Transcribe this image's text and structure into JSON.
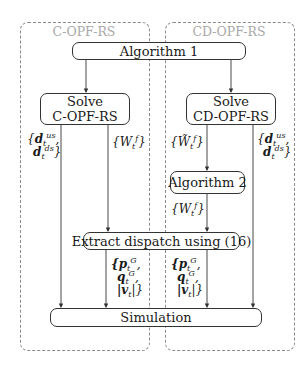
{
  "groups": {
    "left": {
      "label": "C-OPF-RS"
    },
    "right": {
      "label": "CD-OPF-RS"
    }
  },
  "nodes": {
    "algorithm1": {
      "label": "Algorithm 1"
    },
    "solve_copf": {
      "line1": "Solve",
      "line2": "C-OPF-RS"
    },
    "solve_cdopf": {
      "line1": "Solve",
      "line2": "CD-OPF-RS"
    },
    "algorithm2": {
      "label": "Algorithm 2"
    },
    "extract": {
      "label": "Extract dispatch using (16)"
    },
    "simulation": {
      "label": "Simulation"
    }
  },
  "edge_labels": {
    "left_d": {
      "open": "{",
      "d": "d",
      "sub": "t",
      "sup_us": "us",
      "sup_ds": "ds",
      "close": "}"
    },
    "left_W": {
      "text": "{W",
      "sub": "t",
      "sup": "f",
      "close": "}"
    },
    "right_Wtilde": {
      "text": "{W̃",
      "sub": "t",
      "sup": "f",
      "close": "}"
    },
    "right_d": {
      "open": "{",
      "d": "d",
      "sub": "t",
      "sup_us": "us",
      "sup_ds": "ds",
      "close": "}"
    },
    "right_W": {
      "text": "{W",
      "sub": "t",
      "sup": "f",
      "close": "}"
    },
    "dispatch_left": {
      "p": "{p",
      "q": "q",
      "v": "|v",
      "sub": "t",
      "sup": "G",
      "close": "|}"
    },
    "dispatch_right": {
      "p": "{p",
      "q": "q",
      "v": "|v",
      "sub": "t",
      "sup": "G",
      "close": "|}"
    }
  },
  "colors": {
    "stroke": "#333333",
    "dashed": "#8a8a8a",
    "group_label": "#a8a8a8"
  }
}
